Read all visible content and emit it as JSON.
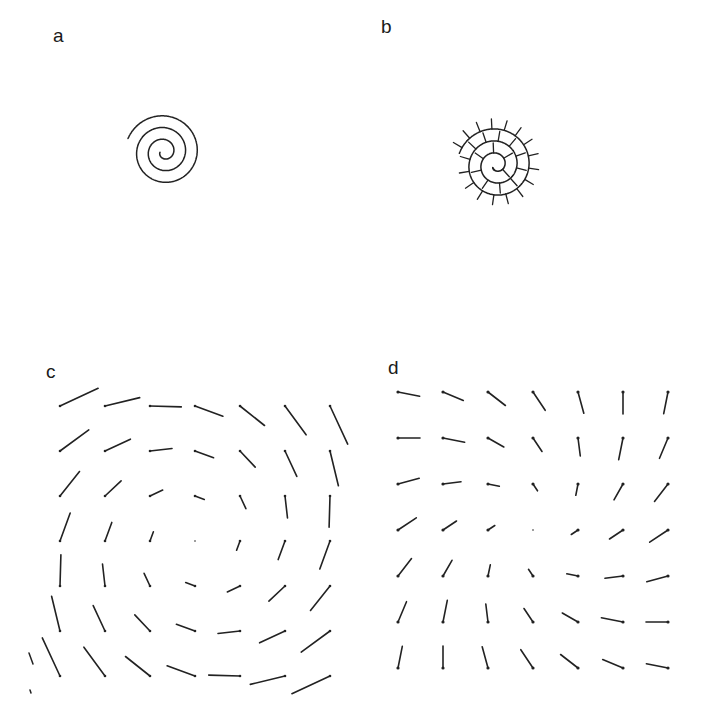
{
  "figure": {
    "width": 716,
    "height": 713,
    "ink_color": "#222222",
    "background": "#ffffff"
  },
  "panels": {
    "a": {
      "label": "a",
      "label_pos": [
        53,
        42
      ],
      "description": "Archimedean spiral curve",
      "spiral": {
        "cx": 164,
        "cy": 152,
        "a0": 3.5,
        "b": 11.2,
        "theta_start": 0.3,
        "theta_end": 18.7,
        "rot": 3.35
      }
    },
    "b": {
      "label": "b",
      "label_pos": [
        381,
        33
      ],
      "description": "Spiral with short perpendicular ticks along the outer side",
      "spiral": {
        "cx": 496,
        "cy": 165,
        "a0": 3.0,
        "b": 11.5,
        "theta_start": 0.6,
        "theta_end": 18.5,
        "rot": 3.1
      },
      "tick_spacing": 12,
      "tick_length": 10
    },
    "c": {
      "label": "c",
      "label_pos": [
        46,
        378
      ],
      "description": "7x7 grid of line segments forming a rotating (vortex) field",
      "grid": {
        "cols": 7,
        "rows": 7,
        "x0": 60,
        "y0": 406,
        "dx": 45,
        "dy": 45,
        "center_col": 3,
        "center_row": 3,
        "scale": 11,
        "rotation": -1.45
      },
      "extra_marks": [
        [
          29,
          653,
          33,
          664
        ],
        [
          30,
          690,
          31,
          693
        ]
      ]
    },
    "d": {
      "label": "d",
      "label_pos": [
        388,
        374
      ],
      "description": "7x7 grid of short segments forming a saddle-type field with dotted ends",
      "grid": {
        "cols": 7,
        "rows": 7,
        "x0": 398,
        "y0": 392,
        "dx": 45,
        "dy": 46,
        "center_col": 3,
        "center_row": 3,
        "scale": 7.5
      }
    }
  }
}
